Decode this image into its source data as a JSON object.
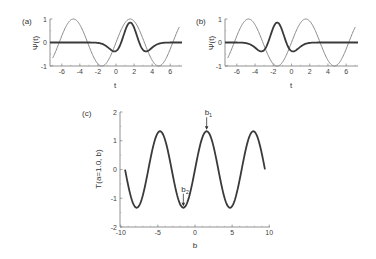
{
  "chart_data": [
    {
      "panel": "(a)",
      "type": "line",
      "xlabel": "t",
      "ylabel": "Ψ(t)",
      "xlim": [
        -7.3,
        7.3
      ],
      "ylim": [
        -1,
        1
      ],
      "xticks": [
        "-6",
        "-4",
        "-2",
        "0",
        "2",
        "4",
        "6"
      ],
      "yticks": [
        "1",
        "0",
        "-1"
      ],
      "grid": false,
      "series": [
        {
          "name": "sin(t)",
          "style": "thin gray",
          "formula": "sin(t)",
          "x": [
            -7,
            -4.71,
            -1.57,
            1.57,
            4.71,
            7
          ],
          "y": [
            -0.66,
            1,
            -1,
            1,
            -1,
            0.66
          ]
        },
        {
          "name": "wavelet centered at π/2",
          "style": "thick dark",
          "center": 1.57,
          "x": [
            -7,
            -0.16,
            1.57,
            3.3,
            7
          ],
          "y": [
            0,
            -0.38,
            0.85,
            -0.38,
            0
          ]
        }
      ]
    },
    {
      "panel": "(b)",
      "type": "line",
      "xlabel": "t",
      "ylabel": "Ψ(t)",
      "xlim": [
        -7.3,
        7.3
      ],
      "ylim": [
        -1,
        1
      ],
      "xticks": [
        "-6",
        "-4",
        "-2",
        "0",
        "2",
        "4",
        "6"
      ],
      "yticks": [
        "1",
        "0",
        "-1"
      ],
      "grid": false,
      "series": [
        {
          "name": "sin(t)",
          "style": "thin gray",
          "formula": "sin(t)",
          "x": [
            -7,
            -4.71,
            -1.57,
            1.57,
            4.71,
            7
          ],
          "y": [
            -0.66,
            1,
            -1,
            1,
            -1,
            0.66
          ]
        },
        {
          "name": "wavelet centered at -π/2",
          "style": "thick dark",
          "center": -1.57,
          "x": [
            -7,
            -3.3,
            -1.57,
            0.16,
            7
          ],
          "y": [
            0,
            -0.38,
            0.85,
            -0.38,
            0
          ]
        }
      ]
    },
    {
      "panel": "(c)",
      "type": "line",
      "xlabel": "b",
      "ylabel": "T(a=1.0, b)",
      "xlim": [
        -10.1,
        10.1
      ],
      "ylim": [
        -2,
        2
      ],
      "xticks": [
        "-10",
        "-5",
        "0",
        "5",
        "10"
      ],
      "yticks": [
        "2",
        "1",
        "0",
        "-1",
        "-2"
      ],
      "grid": false,
      "series": [
        {
          "name": "T(a=1.0, b)",
          "style": "thick dark",
          "formula": "1.33·sin(b)",
          "x": [
            -9.42,
            -7.85,
            -4.71,
            -1.57,
            1.57,
            4.71,
            7.85,
            9.42
          ],
          "y": [
            0,
            -1.33,
            1.33,
            -1.33,
            1.33,
            -1.33,
            1.33,
            0
          ]
        }
      ],
      "annotations": [
        {
          "text": "b",
          "sub": "1",
          "x": 1.57,
          "y": 1.33,
          "arrow": "down"
        },
        {
          "text": "b",
          "sub": "2",
          "x": -1.57,
          "y": -1.33,
          "arrow": "down"
        }
      ]
    }
  ]
}
